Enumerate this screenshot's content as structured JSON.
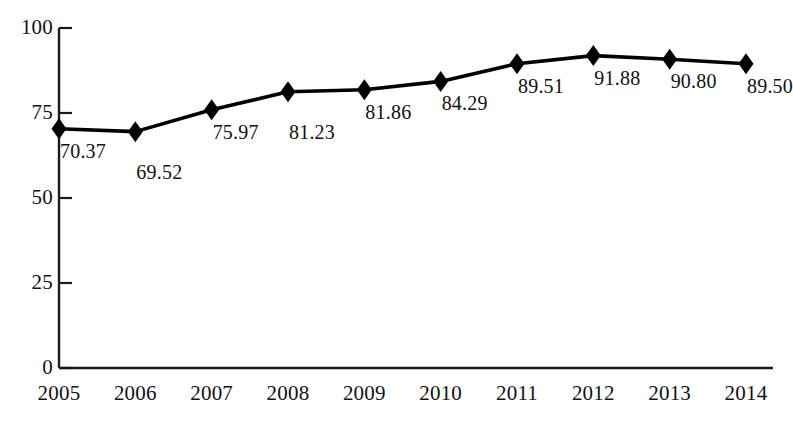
{
  "chart_data": {
    "type": "line",
    "title": "",
    "subtitle": "",
    "xlabel": "",
    "ylabel": "",
    "categories": [
      "2005",
      "2006",
      "2007",
      "2008",
      "2009",
      "2010",
      "2011",
      "2012",
      "2013",
      "2014"
    ],
    "values": [
      70.37,
      69.52,
      75.97,
      81.23,
      81.86,
      84.29,
      89.51,
      91.88,
      90.8,
      89.5
    ],
    "point_labels": [
      "70.37",
      "69.52",
      "75.97",
      "81.23",
      "81.86",
      "84.29",
      "89.51",
      "91.88",
      "90.80",
      "89.50"
    ],
    "ylim": [
      0,
      100
    ],
    "yticks": [
      0,
      25,
      50,
      75,
      100
    ],
    "ytick_labels": [
      "0",
      "25",
      "50",
      "75",
      "100"
    ],
    "xtick_labels": [
      "2005",
      "2006",
      "2007",
      "2008",
      "2009",
      "2010",
      "2011",
      "2012",
      "2013",
      "2014"
    ],
    "grid": false,
    "legend": null,
    "legend_position": "none",
    "series": [
      {
        "name": "",
        "values": [
          70.37,
          69.52,
          75.97,
          81.23,
          81.86,
          84.29,
          89.51,
          91.88,
          90.8,
          89.5
        ],
        "marker": "diamond",
        "color": "#000000"
      }
    ],
    "colors": {
      "line": "#000000",
      "marker": "#000000",
      "axis": "#1a1a1a",
      "text": "#111111",
      "background": "#ffffff"
    }
  }
}
